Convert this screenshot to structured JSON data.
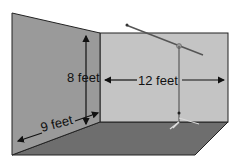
{
  "diagram": {
    "labels": {
      "height": "8 feet",
      "width": "12 feet",
      "depth": "9 feet"
    },
    "colors": {
      "left_wall": "#9a9a9a",
      "back_wall": "#c4c4c4",
      "floor": "#6e6e6e",
      "outline": "#222222"
    }
  }
}
